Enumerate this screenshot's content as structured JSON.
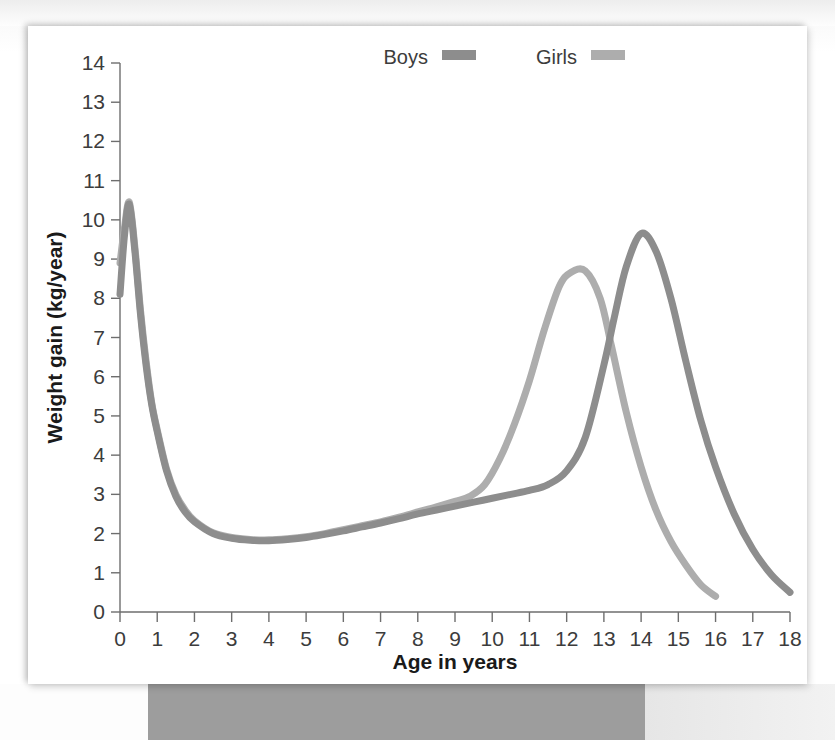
{
  "figure": {
    "background_color": "#ffffff",
    "card_shadow": true
  },
  "chart_data": {
    "type": "line",
    "title": "",
    "xlabel": "Age in years",
    "ylabel": "Weight gain (kg/year)",
    "xlim": [
      0,
      18
    ],
    "ylim": [
      0,
      14
    ],
    "xticks": [
      0,
      1,
      2,
      3,
      4,
      5,
      6,
      7,
      8,
      9,
      10,
      11,
      12,
      13,
      14,
      15,
      16,
      17,
      18
    ],
    "yticks": [
      0,
      1,
      2,
      3,
      4,
      5,
      6,
      7,
      8,
      9,
      10,
      11,
      12,
      13,
      14
    ],
    "xtick_labels": [
      "0",
      "1",
      "2",
      "3",
      "4",
      "5",
      "6",
      "7",
      "8",
      "9",
      "10",
      "11",
      "12",
      "13",
      "14",
      "15",
      "16",
      "17",
      "18"
    ],
    "ytick_labels": [
      "0",
      "1",
      "2",
      "3",
      "4",
      "5",
      "6",
      "7",
      "8",
      "9",
      "10",
      "11",
      "12",
      "13",
      "14"
    ],
    "grid": false,
    "legend_position": "top-center",
    "series": [
      {
        "name": "Boys",
        "color": "#8d8d8d",
        "line_width": 7,
        "peak_age": 14.0,
        "peak_value": 9.65,
        "x": [
          0,
          0.12,
          0.25,
          0.4,
          0.55,
          0.7,
          0.85,
          1.0,
          1.25,
          1.5,
          1.75,
          2.0,
          2.5,
          3.0,
          3.5,
          4.0,
          4.5,
          5.0,
          5.5,
          6.0,
          6.5,
          7.0,
          7.5,
          8.0,
          8.5,
          9.0,
          9.5,
          10.0,
          10.5,
          11.0,
          11.5,
          12.0,
          12.5,
          13.0,
          13.3,
          13.6,
          14.0,
          14.4,
          14.8,
          15.2,
          15.6,
          16.0,
          16.5,
          17.0,
          17.5,
          18.0
        ],
        "y": [
          8.1,
          9.6,
          10.4,
          9.2,
          7.6,
          6.3,
          5.3,
          4.6,
          3.6,
          2.95,
          2.55,
          2.3,
          2.0,
          1.88,
          1.83,
          1.82,
          1.85,
          1.9,
          1.98,
          2.07,
          2.17,
          2.27,
          2.38,
          2.5,
          2.6,
          2.7,
          2.8,
          2.9,
          3.0,
          3.1,
          3.25,
          3.6,
          4.45,
          6.3,
          7.6,
          8.8,
          9.65,
          9.2,
          8.0,
          6.4,
          4.9,
          3.7,
          2.5,
          1.6,
          0.95,
          0.5
        ]
      },
      {
        "name": "Girls",
        "color": "#adadad",
        "line_width": 7,
        "peak_age": 12.5,
        "peak_value": 8.7,
        "x": [
          0,
          0.12,
          0.25,
          0.4,
          0.55,
          0.7,
          0.85,
          1.0,
          1.25,
          1.5,
          1.75,
          2.0,
          2.5,
          3.0,
          3.5,
          4.0,
          4.5,
          5.0,
          5.5,
          6.0,
          6.5,
          7.0,
          7.5,
          8.0,
          8.5,
          9.0,
          9.4,
          9.8,
          10.2,
          10.6,
          11.0,
          11.4,
          11.8,
          12.1,
          12.5,
          12.9,
          13.2,
          13.6,
          14.0,
          14.4,
          14.8,
          15.2,
          15.6,
          16.0
        ],
        "y": [
          8.9,
          9.8,
          10.45,
          9.3,
          7.7,
          6.4,
          5.35,
          4.65,
          3.65,
          3.0,
          2.6,
          2.33,
          2.02,
          1.9,
          1.85,
          1.84,
          1.87,
          1.92,
          2.0,
          2.1,
          2.2,
          2.3,
          2.42,
          2.55,
          2.68,
          2.82,
          2.95,
          3.25,
          3.9,
          4.8,
          5.9,
          7.2,
          8.3,
          8.65,
          8.7,
          8.0,
          6.8,
          5.1,
          3.7,
          2.6,
          1.8,
          1.2,
          0.7,
          0.4
        ]
      }
    ],
    "legend": [
      {
        "label": "Boys",
        "color": "#8d8d8d"
      },
      {
        "label": "Girls",
        "color": "#adadad"
      }
    ]
  }
}
